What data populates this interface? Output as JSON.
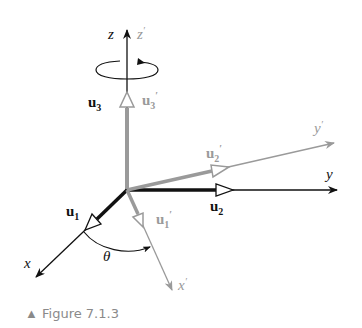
{
  "figure": {
    "caption": "Figure 7.1.3",
    "caption_marker": "▲"
  },
  "axes": {
    "x": "x",
    "y": "y",
    "z": "z",
    "x_prime": "x",
    "y_prime": "y",
    "z_prime": "z",
    "prime": "′",
    "angle": "θ"
  },
  "vectors": {
    "u1": {
      "base": "u",
      "sub": "1"
    },
    "u2": {
      "base": "u",
      "sub": "2"
    },
    "u3": {
      "base": "u",
      "sub": "3"
    },
    "u1p": {
      "base": "u",
      "sub": "1",
      "prime": "′"
    },
    "u2p": {
      "base": "u",
      "sub": "2",
      "prime": "′"
    },
    "u3p": {
      "base": "u",
      "sub": "3",
      "prime": "′"
    }
  },
  "colors": {
    "original": "#111111",
    "rotated": "#9a9a9a",
    "caption": "#8a8a8a"
  }
}
